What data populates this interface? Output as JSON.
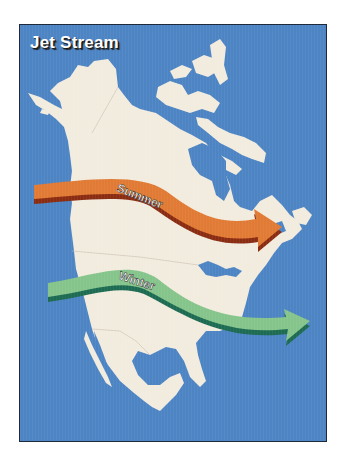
{
  "map": {
    "title": "Jet Stream",
    "colors": {
      "ocean": "#4d84c4",
      "land": "#f2ecdf",
      "summer_arrow": "#e07a34",
      "summer_edge": "#8a2c12",
      "winter_arrow": "#85c48a",
      "winter_edge": "#1d6b52"
    },
    "arrows": [
      {
        "label": "Summer",
        "color_name": "orange"
      },
      {
        "label": "Winter",
        "color_name": "green"
      }
    ],
    "region": "North America"
  }
}
